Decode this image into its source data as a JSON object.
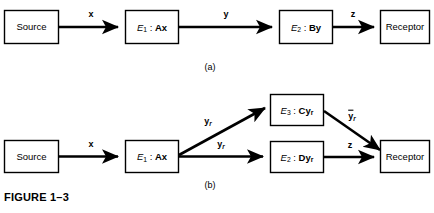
{
  "figure": {
    "caption": "FIGURE 1–3",
    "panel_a_label": "(a)",
    "panel_b_label": "(b)"
  },
  "panel_a": {
    "nodes": [
      {
        "id": "source",
        "text_plain": "Source",
        "label": "Source"
      },
      {
        "id": "e1",
        "text_plain": "E1 : Ax",
        "symbol": "E",
        "subscript": "1",
        "expression": "Ax"
      },
      {
        "id": "e2",
        "text_plain": "E2 : By",
        "symbol": "E",
        "subscript": "2",
        "expression": "By"
      },
      {
        "id": "receptor",
        "text_plain": "Receptor",
        "label": "Receptor"
      }
    ],
    "edges": [
      {
        "from": "source",
        "to": "e1",
        "label": "x",
        "label_plain": "x"
      },
      {
        "from": "e1",
        "to": "e2",
        "label": "y",
        "label_plain": "y"
      },
      {
        "from": "e2",
        "to": "receptor",
        "label": "z",
        "label_plain": "z"
      }
    ]
  },
  "panel_b": {
    "nodes": [
      {
        "id": "source",
        "text_plain": "Source",
        "label": "Source"
      },
      {
        "id": "e1",
        "text_plain": "E1 : Ax",
        "symbol": "E",
        "subscript": "1",
        "expression": "Ax"
      },
      {
        "id": "e3",
        "text_plain": "E3 : Cyr",
        "symbol": "E",
        "subscript": "3",
        "expression": "Cy",
        "expression_sub": "r"
      },
      {
        "id": "e2",
        "text_plain": "E2 : Dyr",
        "symbol": "E",
        "subscript": "2",
        "expression": "Dy",
        "expression_sub": "r"
      },
      {
        "id": "receptor",
        "text_plain": "Receptor",
        "label": "Receptor"
      }
    ],
    "edges": [
      {
        "from": "source",
        "to": "e1",
        "label_plain": "x",
        "base": "x",
        "sub": "",
        "overbar": false
      },
      {
        "from": "e1",
        "to": "e3",
        "label_plain": "yr",
        "base": "y",
        "sub": "r",
        "overbar": false
      },
      {
        "from": "e1",
        "to": "e2",
        "label_plain": "yr",
        "base": "y",
        "sub": "r",
        "overbar": false
      },
      {
        "from": "e3",
        "to": "receptor",
        "label_plain": "ȳr",
        "base": "y",
        "sub": "r",
        "overbar": true
      },
      {
        "from": "e2",
        "to": "receptor",
        "label_plain": "z",
        "base": "z",
        "sub": "",
        "overbar": false
      }
    ]
  },
  "colors": {
    "background": "#ffffff",
    "stroke": "#000000",
    "box_fill": "#ffffff",
    "text": "#000000"
  }
}
